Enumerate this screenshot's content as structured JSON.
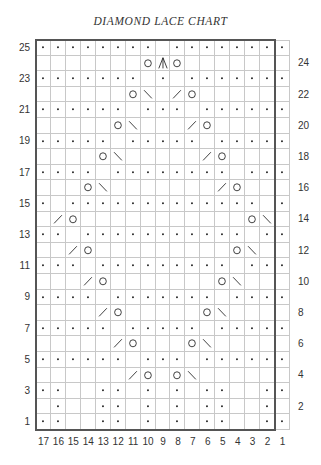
{
  "title": "DIAMOND LACE CHART",
  "chart": {
    "columns": 17,
    "rows": 25,
    "pattern_repeat_columns": [
      17,
      2
    ],
    "edge_column": 1,
    "column_labels": [
      "17",
      "16",
      "15",
      "14",
      "13",
      "12",
      "11",
      "10",
      "9",
      "8",
      "7",
      "6",
      "5",
      "4",
      "3",
      "2",
      "1"
    ],
    "row_labels_left": [
      "25",
      "23",
      "21",
      "19",
      "17",
      "15",
      "13",
      "11",
      "9",
      "7",
      "5",
      "3",
      "1"
    ],
    "row_labels_right": [
      "24",
      "22",
      "20",
      "18",
      "16",
      "14",
      "12",
      "10",
      "8",
      "6",
      "4",
      "2"
    ],
    "legend_symbols": {
      "dot": "purl",
      "blank": "knit",
      "O": "yarn-over",
      "/": "k2tog",
      "\\": "ssk",
      "^": "centered-double-decrease"
    },
    "grid_rows": {
      "25": ". . . . . . . . _ . . . . . . . .",
      "24": "_ _ _ _ _ _ _ O ^ O _ _ _ _ _ _ _",
      "23": ". . . . . . . _ . _ . . . . . . .",
      "22": "_ _ _ _ _ _ O \\ _ / O _ _ _ _ _ _",
      "21": ". . . . . . _ . . . _ . . . . . .",
      "20": "_ _ _ _ _ O \\ _ _ _ / O _ _ _ _ _",
      "19": ". . . . . _ . . . . . _ . . . . .",
      "18": "_ _ _ _ O \\ _ _ _ _ _ / O _ _ _ _",
      "17": ". . . . _ . . . . . . . . _ . . .",
      "16": "_ _ _ O \\ _ _ _ _ _ _ _ / O _ _ _",
      "15": ". _ . . . . . . . . . . . . . _ .",
      "14": "_ / O _ _ _ _ _ _ _ _ _ _ _ O \\ _",
      "13": ". . _ . . . . . . . . . . . _ . .",
      "12": "_ _ / O _ _ _ _ _ _ _ _ _ O \\ _ _",
      "11": ". . . _ . . . . . . . . . _ . . .",
      "10": "_ _ _ / O _ _ _ _ _ _ _ O \\ _ _ _",
      "9": ". . . . _ . . . . . . . _ . . . .",
      "8": "_ _ _ _ / O _ _ _ _ _ O \\ _ _ _ _",
      "7": ". . . . . _ . . . . . _ . . . . .",
      "6": "_ _ _ _ _ / O _ _ _ O \\ _ _ _ _ _",
      "5": ". . . . . . _ . . . _ . . . . . .",
      "4": "_ _ _ _ _ _ / O _ O \\ _ _ _ _ _ _",
      "3": ". . _ _ . . _ . _ . _ . . _ _ . .",
      "2": "_ . _ _ . . _ . _ . _ . . _ _ . _",
      "1": ". . _ _ . . _ . _ . _ . . _ _ . ."
    },
    "colors": {
      "grid_line": "#c8c8c8",
      "outline": "#555555",
      "symbol": "#222222"
    }
  }
}
